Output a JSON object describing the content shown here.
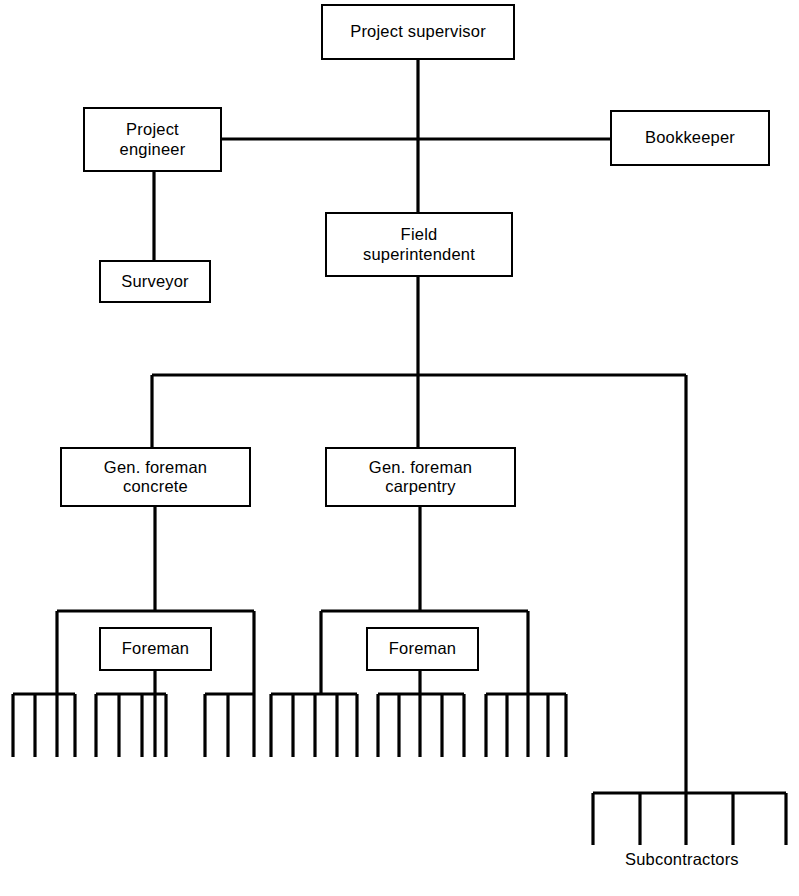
{
  "diagram": {
    "type": "organization-chart",
    "line_color": "#000000",
    "background_color": "#ffffff",
    "nodes": [
      {
        "id": "project-supervisor",
        "label": "Project supervisor",
        "x": 321,
        "y": 4,
        "w": 194,
        "h": 56
      },
      {
        "id": "project-engineer",
        "label": "Project\nengineer",
        "x": 83,
        "y": 107,
        "w": 139,
        "h": 65
      },
      {
        "id": "bookkeeper",
        "label": "Bookkeeper",
        "x": 610,
        "y": 110,
        "w": 160,
        "h": 56
      },
      {
        "id": "field-superintendent",
        "label": "Field\nsuperintendent",
        "x": 325,
        "y": 212,
        "w": 188,
        "h": 65
      },
      {
        "id": "surveyor",
        "label": "Surveyor",
        "x": 99,
        "y": 260,
        "w": 112,
        "h": 43
      },
      {
        "id": "gen-foreman-concrete",
        "label": "Gen. foreman\nconcrete",
        "x": 60,
        "y": 447,
        "w": 191,
        "h": 60
      },
      {
        "id": "gen-foreman-carpentry",
        "label": "Gen. foreman\ncarpentry",
        "x": 325,
        "y": 447,
        "w": 191,
        "h": 60
      },
      {
        "id": "foreman-concrete",
        "label": "Foreman",
        "x": 99,
        "y": 627,
        "w": 113,
        "h": 44
      },
      {
        "id": "foreman-carpentry",
        "label": "Foreman",
        "x": 366,
        "y": 627,
        "w": 113,
        "h": 44
      }
    ],
    "free_labels": [
      {
        "id": "subcontractors",
        "label": "Subcontractors",
        "x": 625,
        "y": 850
      }
    ],
    "edges": [
      {
        "id": "spine-supervisor-to-field",
        "path": "M418,60 L418,212"
      },
      {
        "id": "engineer-to-bookkeeper-bus",
        "path": "M222,139 L610,139"
      },
      {
        "id": "engineer-to-surveyor",
        "path": "M154,172 L154,260"
      },
      {
        "id": "field-down-to-bus",
        "path": "M418,277 L418,375"
      },
      {
        "id": "foreman-bus",
        "path": "M152,375 L686,375"
      },
      {
        "id": "bus-to-gf-concrete",
        "path": "M152,375 L152,447"
      },
      {
        "id": "bus-to-gf-carpentry",
        "path": "M418,375 L418,447"
      },
      {
        "id": "bus-to-subcontractors",
        "path": "M686,375 L686,793"
      },
      {
        "id": "gf-concrete-down",
        "path": "M155,507 L155,611"
      },
      {
        "id": "gf-carpentry-down",
        "path": "M420,507 L420,611"
      },
      {
        "id": "crew-bus-concrete",
        "path": "M57,611 L254,611"
      },
      {
        "id": "crew-bus-concrete-left-drop",
        "path": "M57,611 L57,694"
      },
      {
        "id": "crew-bus-concrete-right-drop",
        "path": "M254,611 L254,694"
      },
      {
        "id": "foreman-concrete-down",
        "path": "M155,671 L155,694"
      },
      {
        "id": "crew-bus-carpentry",
        "path": "M321,611 L528,611"
      },
      {
        "id": "crew-bus-carpentry-left-drop",
        "path": "M321,611 L321,694"
      },
      {
        "id": "crew-bus-carpentry-right-drop",
        "path": "M528,611 L528,694"
      },
      {
        "id": "foreman-carpentry-down",
        "path": "M420,671 L420,694"
      }
    ],
    "combs": [
      {
        "id": "crew-comb-1",
        "bar_y": 694,
        "x1": 13,
        "x2": 75,
        "tine_x": [
          13,
          35,
          57,
          75
        ],
        "tine_bottom": 757
      },
      {
        "id": "crew-comb-2",
        "bar_y": 694,
        "x1": 96,
        "x2": 166,
        "tine_x": [
          96,
          119,
          142,
          155,
          166
        ],
        "tine_bottom": 757
      },
      {
        "id": "crew-comb-3",
        "bar_y": 694,
        "x1": 205,
        "x2": 254,
        "tine_x": [
          205,
          228,
          254
        ],
        "tine_bottom": 757
      },
      {
        "id": "crew-comb-4",
        "bar_y": 694,
        "x1": 271,
        "x2": 357,
        "tine_x": [
          271,
          293,
          315,
          337,
          357
        ],
        "tine_bottom": 757
      },
      {
        "id": "crew-comb-5",
        "bar_y": 694,
        "x1": 378,
        "x2": 464,
        "tine_x": [
          378,
          399,
          420,
          442,
          464
        ],
        "tine_bottom": 757
      },
      {
        "id": "crew-comb-6",
        "bar_y": 694,
        "x1": 486,
        "x2": 566,
        "tine_x": [
          486,
          507,
          528,
          548,
          566
        ],
        "tine_bottom": 757
      },
      {
        "id": "subcontractor-comb",
        "bar_y": 793,
        "x1": 593,
        "x2": 786,
        "tine_x": [
          593,
          640,
          686,
          733,
          786
        ],
        "tine_bottom": 845
      }
    ]
  }
}
